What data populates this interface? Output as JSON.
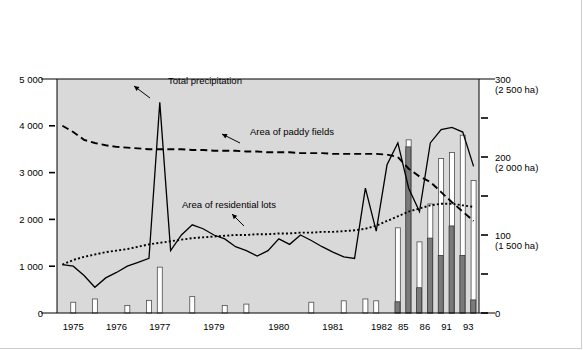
{
  "legend": {
    "items": [
      {
        "label": "Houses flooded above floor level",
        "swatch": "filled-square-icon",
        "color": "#7a7a7a"
      },
      {
        "label": "Houses flooded below floor level",
        "swatch": "hollow-square-icon",
        "color": "#ffffff"
      }
    ]
  },
  "axes": {
    "left_caption": "Number of houses flooded",
    "right_caption_line1": "Total precipitation (mm)",
    "right_caption_line2": "(areas of paddy field and residential lots)",
    "left_ticks": [
      "5 000",
      "4 000",
      "3 000",
      "2 000",
      "1 000",
      "0"
    ],
    "right_ticks": [
      "300",
      "200",
      "100",
      "0"
    ],
    "right_tick_subs": [
      "(2 500 ha)",
      "(2 000 ha)",
      "(1 500 ha)",
      ""
    ],
    "x_ticks": [
      "1975",
      "1976",
      "1977",
      "1979",
      "1980",
      "1981",
      "1982",
      "85",
      "86",
      "91",
      "93"
    ]
  },
  "annotations": [
    {
      "text": "Total precipitation",
      "name": "annotation-total-precipitation"
    },
    {
      "text": "Area of paddy fields",
      "name": "annotation-area-paddy-fields"
    },
    {
      "text": "Area of residential lots",
      "name": "annotation-area-residential-lots"
    }
  ],
  "chart_data": {
    "type": "bar",
    "title": "",
    "subtitle": "",
    "xlabel": "",
    "ylabel": "Number of houses flooded",
    "y2label": "Total precipitation (mm) (areas of paddy field and residential lots)",
    "ylim": [
      0,
      5000
    ],
    "y2lim": [
      0,
      300
    ],
    "grid": false,
    "legend_position": "top",
    "x_tick_labels": [
      "1975",
      "1976",
      "1977",
      "1979",
      "1980",
      "1981",
      "1982",
      "85",
      "86",
      "91",
      "93"
    ],
    "x_tick_positions": [
      1.5,
      5.5,
      9.5,
      14.5,
      20.5,
      25.5,
      30.0,
      32.0,
      34.0,
      36.0,
      38.0
    ],
    "n_events": 39,
    "series": [
      {
        "name": "Houses flooded below floor level",
        "type": "bar",
        "axis": "left",
        "color": "#ffffff",
        "edge": "#4d4d4d",
        "values": [
          0,
          230,
          0,
          300,
          0,
          0,
          160,
          0,
          270,
          980,
          0,
          0,
          350,
          0,
          0,
          160,
          0,
          190,
          0,
          0,
          0,
          0,
          0,
          230,
          0,
          0,
          260,
          0,
          300,
          260,
          0,
          1820,
          3700,
          1520,
          2330,
          3300,
          3430,
          3800,
          2830
        ]
      },
      {
        "name": "Houses flooded above floor level",
        "type": "bar",
        "axis": "left",
        "color": "#7a7a7a",
        "edge": "#3a3a3a",
        "values": [
          0,
          0,
          0,
          0,
          0,
          0,
          0,
          0,
          0,
          0,
          0,
          0,
          0,
          0,
          0,
          0,
          0,
          0,
          0,
          0,
          0,
          0,
          0,
          0,
          0,
          0,
          0,
          0,
          0,
          0,
          0,
          240,
          3550,
          540,
          1600,
          1230,
          1860,
          1230,
          280
        ]
      },
      {
        "name": "Total precipitation",
        "type": "line",
        "axis": "right",
        "style": "solid",
        "color": "#000000",
        "values": [
          62,
          60,
          48,
          33,
          45,
          52,
          60,
          65,
          70,
          270,
          80,
          100,
          113,
          108,
          100,
          95,
          85,
          80,
          73,
          80,
          95,
          88,
          100,
          93,
          85,
          78,
          72,
          70,
          160,
          105,
          190,
          218,
          160,
          130,
          218,
          235,
          238,
          232,
          188
        ]
      },
      {
        "name": "Area of paddy fields",
        "type": "line",
        "axis": "right",
        "style": "dashed",
        "color": "#000000",
        "values": [
          240,
          232,
          222,
          218,
          215,
          213,
          212,
          211,
          210,
          210,
          210,
          210,
          209,
          209,
          208,
          208,
          208,
          207,
          207,
          206,
          206,
          206,
          205,
          205,
          205,
          204,
          204,
          204,
          204,
          204,
          203,
          200,
          185,
          175,
          168,
          155,
          142,
          130,
          118
        ]
      },
      {
        "name": "Area of residential lots",
        "type": "line",
        "axis": "right",
        "style": "dotted",
        "color": "#000000",
        "values": [
          62,
          68,
          72,
          75,
          78,
          80,
          82,
          85,
          88,
          90,
          92,
          94,
          96,
          97,
          98,
          99,
          100,
          100,
          101,
          101,
          102,
          102,
          103,
          103,
          104,
          104,
          105,
          106,
          108,
          112,
          118,
          124,
          130,
          134,
          138,
          140,
          140,
          138,
          136
        ]
      }
    ]
  }
}
